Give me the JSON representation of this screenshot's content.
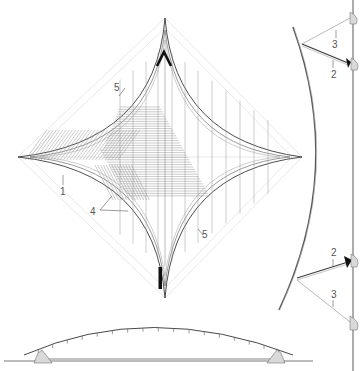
{
  "drawing": {
    "title": "Tensile roof — plan, section and elevation",
    "colors": {
      "line": "#3a3a3a",
      "hatch": "#8a8a8a",
      "faint": "#d8d8d8",
      "label": "#555555",
      "footing": "#d9d9d9",
      "solid": "#111111"
    },
    "plan": {
      "labels": [
        {
          "id": "5-top",
          "text": "5"
        },
        {
          "id": "1",
          "text": "1"
        },
        {
          "id": "4",
          "text": "4"
        },
        {
          "id": "5-bottom",
          "text": "5"
        }
      ],
      "markers": [
        "top-chevron-marker",
        "bottom-bar-marker"
      ]
    },
    "side_section": {
      "labels": [
        {
          "id": "3-top",
          "text": "3"
        },
        {
          "id": "2-top",
          "text": "2"
        },
        {
          "id": "2-bottom",
          "text": "2"
        },
        {
          "id": "3-bottom",
          "text": "3"
        }
      ]
    },
    "elevation": {
      "tick_count": 17
    }
  }
}
